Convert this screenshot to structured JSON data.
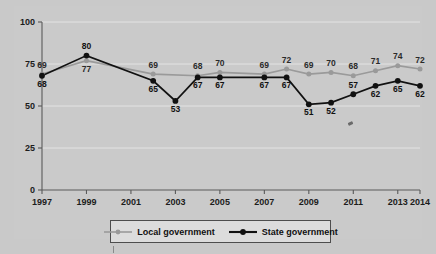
{
  "chart_data": {
    "type": "line",
    "title": "",
    "xlabel": "",
    "ylabel": "",
    "ylim": [
      0,
      100
    ],
    "xlim": [
      1997,
      2014
    ],
    "yticks": [
      "0",
      "25",
      "50",
      "75",
      "100"
    ],
    "ytick_values": [
      0,
      25,
      50,
      75,
      100
    ],
    "xticks": [
      "1997",
      "1999",
      "2001",
      "2003",
      "2005",
      "2007",
      "2009",
      "2011",
      "2013",
      "2014"
    ],
    "xtick_values": [
      1997,
      1999,
      2001,
      2003,
      2005,
      2007,
      2009,
      2011,
      2013,
      2014
    ],
    "grid": true,
    "legend_position": "bottom-center",
    "series": [
      {
        "name": "Local government",
        "color": "#9a9a9a",
        "marker": "circle",
        "x": [
          1997,
          1999,
          2002,
          2004,
          2005,
          2007,
          2008,
          2009,
          2010,
          2011,
          2012,
          2013,
          2014
        ],
        "values": [
          69,
          77,
          69,
          68,
          70,
          69,
          72,
          69,
          70,
          68,
          71,
          74,
          72
        ],
        "labels": [
          "69",
          "77",
          "69",
          "68",
          "70",
          "69",
          "72",
          "69",
          "70",
          "68",
          "71",
          "74",
          "72"
        ],
        "label_pos": [
          "above",
          "below",
          "above",
          "above",
          "above",
          "above",
          "above",
          "above",
          "above",
          "above",
          "above",
          "above",
          "above"
        ]
      },
      {
        "name": "State government",
        "color": "#111111",
        "marker": "circle",
        "x": [
          1997,
          1999,
          2002,
          2003,
          2004,
          2005,
          2007,
          2008,
          2009,
          2010,
          2011,
          2012,
          2013,
          2014
        ],
        "values": [
          68,
          80,
          65,
          53,
          67,
          67,
          67,
          67,
          51,
          52,
          57,
          62,
          65,
          62
        ],
        "labels": [
          "68",
          "80",
          "65",
          "53",
          "67",
          "67",
          "67",
          "67",
          "51",
          "52",
          "57",
          "62",
          "65",
          "62"
        ],
        "label_pos": [
          "below",
          "above",
          "below",
          "below",
          "below",
          "below",
          "below",
          "below",
          "below",
          "below",
          "above",
          "below",
          "below",
          "below"
        ]
      }
    ]
  },
  "legend": {
    "items": [
      {
        "label": "Local government",
        "color": "#9a9a9a"
      },
      {
        "label": "State government",
        "color": "#111111"
      }
    ]
  }
}
